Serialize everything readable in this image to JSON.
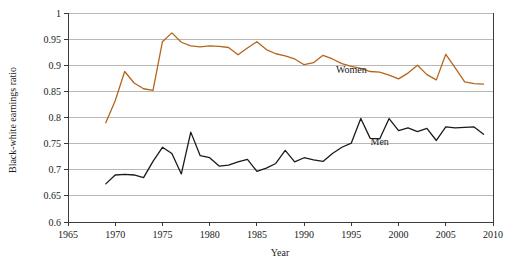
{
  "chart_data": {
    "type": "line",
    "title": "",
    "xlabel": "Year",
    "ylabel": "Black-white earnings ratio",
    "xlim": [
      1965,
      2010
    ],
    "ylim": [
      0.6,
      1
    ],
    "xticks": [
      1965,
      1970,
      1975,
      1980,
      1985,
      1990,
      1995,
      2000,
      2005,
      2010
    ],
    "yticks": [
      0.6,
      0.65,
      0.7,
      0.75,
      0.8,
      0.85,
      0.9,
      0.95,
      1
    ],
    "xtick_labels": [
      "1965",
      "1970",
      "1975",
      "1980",
      "1985",
      "1990",
      "1995",
      "2000",
      "2005",
      "2010"
    ],
    "ytick_labels": [
      "0.6",
      "0.65",
      "0.7",
      "0.75",
      "0.8",
      "0.85",
      "0.9",
      "0.95",
      "1"
    ],
    "grid": true,
    "legend_position": "inline-annotation",
    "series": [
      {
        "name": "Women",
        "color": "#b5651d",
        "label_x": 1995,
        "label_y": 0.885,
        "x": [
          1969,
          1970,
          1971,
          1972,
          1973,
          1974,
          1975,
          1976,
          1977,
          1978,
          1979,
          1980,
          1981,
          1982,
          1983,
          1984,
          1985,
          1986,
          1987,
          1988,
          1989,
          1990,
          1991,
          1992,
          1993,
          1994,
          1995,
          1996,
          1997,
          1998,
          1999,
          2000,
          2001,
          2002,
          2003,
          2004,
          2005,
          2006,
          2007,
          2008,
          2009
        ],
        "values": [
          0.79,
          0.832,
          0.888,
          0.866,
          0.855,
          0.852,
          0.945,
          0.962,
          0.944,
          0.937,
          0.935,
          0.937,
          0.936,
          0.934,
          0.92,
          0.933,
          0.945,
          0.93,
          0.922,
          0.918,
          0.912,
          0.901,
          0.905,
          0.919,
          0.912,
          0.903,
          0.898,
          0.894,
          0.888,
          0.887,
          0.881,
          0.874,
          0.885,
          0.9,
          0.882,
          0.872,
          0.921,
          0.895,
          0.868,
          0.865,
          0.864
        ]
      },
      {
        "name": "Men",
        "color": "#1a1a1a",
        "label_x": 1998,
        "label_y": 0.747,
        "x": [
          1969,
          1970,
          1971,
          1972,
          1973,
          1974,
          1975,
          1976,
          1977,
          1978,
          1979,
          1980,
          1981,
          1982,
          1983,
          1984,
          1985,
          1986,
          1987,
          1988,
          1989,
          1990,
          1991,
          1992,
          1993,
          1994,
          1995,
          1996,
          1997,
          1998,
          1999,
          2000,
          2001,
          2002,
          2003,
          2004,
          2005,
          2006,
          2007,
          2008,
          2009
        ],
        "values": [
          0.673,
          0.69,
          0.691,
          0.69,
          0.685,
          0.716,
          0.743,
          0.731,
          0.692,
          0.772,
          0.727,
          0.723,
          0.707,
          0.709,
          0.715,
          0.72,
          0.697,
          0.703,
          0.712,
          0.737,
          0.715,
          0.723,
          0.719,
          0.716,
          0.731,
          0.743,
          0.751,
          0.798,
          0.76,
          0.759,
          0.798,
          0.775,
          0.78,
          0.773,
          0.779,
          0.756,
          0.782,
          0.78,
          0.781,
          0.782,
          0.768
        ]
      }
    ]
  },
  "axis": {
    "x_title": "Year",
    "y_title": "Black-white earnings ratio"
  }
}
